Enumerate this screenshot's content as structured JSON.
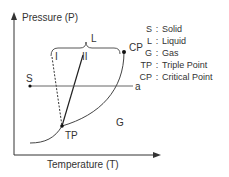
{
  "diagram": {
    "y_axis_label": "Pressure (P)",
    "x_axis_label": "Temperature (T)",
    "brace_label": "L",
    "line_labels": {
      "dashed": "I",
      "solid": "II"
    },
    "points": {
      "critical_point": "CP",
      "triple_point": "TP",
      "start_point": "S",
      "end_point": "a"
    },
    "region_labels": {
      "gas": "G"
    },
    "legend": [
      {
        "key": "S",
        "sep": ":",
        "value": "Solid"
      },
      {
        "key": "L",
        "sep": ":",
        "value": "Liquid"
      },
      {
        "key": "G",
        "sep": ":",
        "value": "Gas"
      },
      {
        "key": "TP",
        "sep": ":",
        "value": "Triple Point"
      },
      {
        "key": "CP",
        "sep": ":",
        "value": "Critical Point"
      }
    ],
    "colors": {
      "line": "#333333",
      "path_line": "#555555"
    }
  }
}
